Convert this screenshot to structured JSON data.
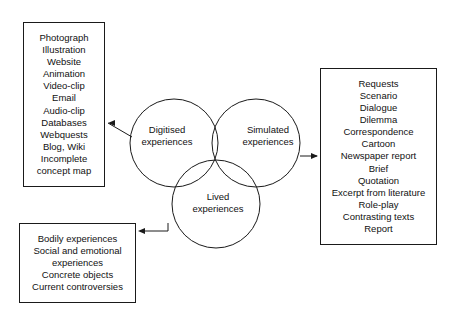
{
  "diagram": {
    "stroke_color": "#1a1a1a",
    "background_color": "#ffffff",
    "text_color": "#111111"
  },
  "circles": [
    {
      "id": "digitised",
      "label_line1": "Digitised",
      "label_line2": "experiences"
    },
    {
      "id": "simulated",
      "label_line1": "Simulated",
      "label_line2": "experiences"
    },
    {
      "id": "lived",
      "label_line1": "Lived",
      "label_line2": "experiences"
    }
  ],
  "boxes": {
    "digitised": {
      "name": "digitised-experiences-list",
      "items": [
        "Photograph",
        "Illustration",
        "Website",
        "Animation",
        "Video-clip",
        "Email",
        "Audio-clip",
        "Databases",
        "Webquests",
        "Blog, Wiki",
        "Incomplete",
        "concept map"
      ]
    },
    "lived": {
      "name": "lived-experiences-list",
      "items": [
        "Bodily experiences",
        "Social and emotional",
        "experiences",
        "Concrete objects",
        "Current controversies"
      ]
    },
    "simulated": {
      "name": "simulated-experiences-list",
      "items": [
        "Requests",
        "Scenario",
        "Dialogue",
        "Dilemma",
        "Correspondence",
        "Cartoon",
        "Newspaper report",
        "Brief",
        "Quotation",
        "Excerpt from literature",
        "Role-play",
        "Contrasting texts",
        "Report"
      ]
    }
  },
  "connectors": [
    {
      "id": "digitised-connector",
      "from": "digitised-circle",
      "to": "digitised-box",
      "direction": "left"
    },
    {
      "id": "simulated-connector",
      "from": "simulated-circle",
      "to": "simulated-box",
      "direction": "right"
    },
    {
      "id": "lived-connector",
      "from": "lived-circle",
      "to": "lived-box",
      "direction": "left"
    }
  ]
}
